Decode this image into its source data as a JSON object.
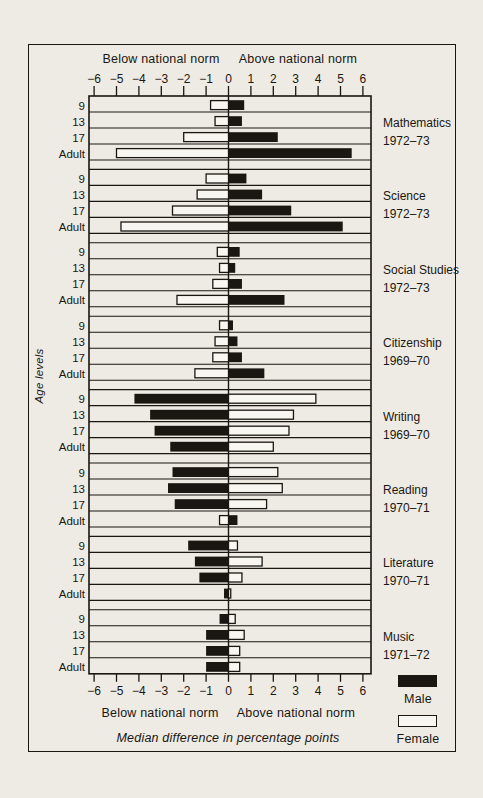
{
  "colors": {
    "ink": "#1a1712",
    "paper": "#eeebe4",
    "bar_fill": "#f8f6f0"
  },
  "figure": {
    "top_left_label": "Below national norm",
    "top_right_label": "Above national norm",
    "bottom_left_label": "Below national norm",
    "bottom_right_label": "Above national norm",
    "axis_title": "Median difference in percentage points",
    "y_axis_label": "Age levels",
    "legend": [
      {
        "label": "Male",
        "filled": true
      },
      {
        "label": "Female",
        "filled": false
      }
    ]
  },
  "chart_data": {
    "type": "bar",
    "orientation": "horizontal-diverging",
    "title": "",
    "xlabel": "Median difference in percentage points",
    "ylabel": "Age levels",
    "xlim": [
      -6,
      6
    ],
    "xticks": [
      -6,
      -5,
      -4,
      -3,
      -2,
      -1,
      0,
      1,
      2,
      3,
      4,
      5,
      6
    ],
    "grid": false,
    "legend_position": "right-bottom",
    "series_names": [
      "Male",
      "Female"
    ],
    "age_levels": [
      "9",
      "13",
      "17",
      "Adult"
    ],
    "groups": [
      {
        "subject": "Mathematics",
        "years": "1972–73",
        "rows": [
          {
            "age": "9",
            "male": 0.7,
            "female": -0.8
          },
          {
            "age": "13",
            "male": 0.6,
            "female": -0.6
          },
          {
            "age": "17",
            "male": 2.2,
            "female": -2.0
          },
          {
            "age": "Adult",
            "male": 5.5,
            "female": -5.0
          }
        ]
      },
      {
        "subject": "Science",
        "years": "1972–73",
        "rows": [
          {
            "age": "9",
            "male": 0.8,
            "female": -1.0
          },
          {
            "age": "13",
            "male": 1.5,
            "female": -1.4
          },
          {
            "age": "17",
            "male": 2.8,
            "female": -2.5
          },
          {
            "age": "Adult",
            "male": 5.1,
            "female": -4.8
          }
        ]
      },
      {
        "subject": "Social Studies",
        "years": "1972–73",
        "rows": [
          {
            "age": "9",
            "male": 0.5,
            "female": -0.5
          },
          {
            "age": "13",
            "male": 0.3,
            "female": -0.4
          },
          {
            "age": "17",
            "male": 0.6,
            "female": -0.7
          },
          {
            "age": "Adult",
            "male": 2.5,
            "female": -2.3
          }
        ]
      },
      {
        "subject": "Citizenship",
        "years": "1969–70",
        "rows": [
          {
            "age": "9",
            "male": 0.2,
            "female": -0.4
          },
          {
            "age": "13",
            "male": 0.4,
            "female": -0.6
          },
          {
            "age": "17",
            "male": 0.6,
            "female": -0.7
          },
          {
            "age": "Adult",
            "male": 1.6,
            "female": -1.5
          }
        ]
      },
      {
        "subject": "Writing",
        "years": "1969–70",
        "rows": [
          {
            "age": "9",
            "male": -4.2,
            "female": 3.9
          },
          {
            "age": "13",
            "male": -3.5,
            "female": 2.9
          },
          {
            "age": "17",
            "male": -3.3,
            "female": 2.7
          },
          {
            "age": "Adult",
            "male": -2.6,
            "female": 2.0
          }
        ]
      },
      {
        "subject": "Reading",
        "years": "1970–71",
        "rows": [
          {
            "age": "9",
            "male": -2.5,
            "female": 2.2
          },
          {
            "age": "13",
            "male": -2.7,
            "female": 2.4
          },
          {
            "age": "17",
            "male": -2.4,
            "female": 1.7
          },
          {
            "age": "Adult",
            "male": 0.4,
            "female": -0.4
          }
        ]
      },
      {
        "subject": "Literature",
        "years": "1970–71",
        "rows": [
          {
            "age": "9",
            "male": -1.8,
            "female": 0.4
          },
          {
            "age": "13",
            "male": -1.5,
            "female": 1.5
          },
          {
            "age": "17",
            "male": -1.3,
            "female": 0.6
          },
          {
            "age": "Adult",
            "male": -0.2,
            "female": 0.1
          }
        ]
      },
      {
        "subject": "Music",
        "years": "1971–72",
        "rows": [
          {
            "age": "9",
            "male": -0.4,
            "female": 0.3
          },
          {
            "age": "13",
            "male": -1.0,
            "female": 0.7
          },
          {
            "age": "17",
            "male": -1.0,
            "female": 0.5
          },
          {
            "age": "Adult",
            "male": -1.0,
            "female": 0.5
          }
        ]
      }
    ]
  }
}
